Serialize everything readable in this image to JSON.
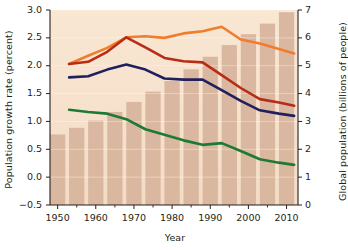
{
  "chart_data": {
    "type": "bar",
    "title": "",
    "subtitle": "",
    "xlabel": "Year",
    "ylabel": "Population growth rate (percent)",
    "ylabel_right": "Global population (billions of people)",
    "xlim": [
      1948,
      2013
    ],
    "ylim": [
      -0.5,
      3.0
    ],
    "ylim_right": [
      0,
      7
    ],
    "ytick_labels": [
      "3.0",
      "2.5",
      "2.0",
      "1.5",
      "1.0",
      "0.5",
      "0.0",
      "−0.5"
    ],
    "ytick_values": [
      3.0,
      2.5,
      2.0,
      1.5,
      1.0,
      0.5,
      0.0,
      -0.5
    ],
    "ytick_right_labels": [
      "7",
      "6",
      "5",
      "4",
      "3",
      "2",
      "1",
      "0"
    ],
    "ytick_right_values": [
      7,
      6,
      5,
      4,
      3,
      2,
      1,
      0
    ],
    "xtick_labels": [
      "1950",
      "1960",
      "1970",
      "1980",
      "1990",
      "2000",
      "2010"
    ],
    "xtick_values": [
      1950,
      1960,
      1970,
      1980,
      1990,
      2000,
      2010
    ],
    "xminor_values": [
      1955,
      1965,
      1975,
      1985,
      1995,
      2005
    ],
    "grid": "horizontal-light",
    "legend_position": "none",
    "plot_background": "#f7e3cf",
    "bars": {
      "name": "Global population",
      "axis": "right",
      "color": "#d8b49d",
      "categories": [
        1950,
        1955,
        1960,
        1965,
        1970,
        1975,
        1980,
        1985,
        1990,
        1995,
        2000,
        2005,
        2010
      ],
      "values": [
        2.53,
        2.77,
        3.03,
        3.34,
        3.7,
        4.07,
        4.45,
        4.87,
        5.32,
        5.74,
        6.13,
        6.51,
        6.92
      ]
    },
    "series": [
      {
        "name": "Less developed regions growth rate",
        "color": "#ef7d2c",
        "axis": "left",
        "x": [
          1953,
          1958,
          1963,
          1968,
          1973,
          1978,
          1983,
          1988,
          1993,
          1998,
          2003,
          2008,
          2012
        ],
        "values": [
          2.03,
          2.18,
          2.32,
          2.51,
          2.53,
          2.5,
          2.58,
          2.62,
          2.7,
          2.47,
          2.4,
          2.3,
          2.22
        ]
      },
      {
        "name": "World growth rate",
        "color": "#b82c17",
        "axis": "left",
        "x": [
          1953,
          1958,
          1963,
          1968,
          1973,
          1978,
          1983,
          1988,
          1993,
          1998,
          2003,
          2008,
          2012
        ],
        "values": [
          2.03,
          2.07,
          2.25,
          2.51,
          2.33,
          2.14,
          2.08,
          2.06,
          1.83,
          1.6,
          1.4,
          1.34,
          1.28
        ]
      },
      {
        "name": "Developing growth rate",
        "color": "#21205e",
        "axis": "left",
        "x": [
          1953,
          1958,
          1963,
          1968,
          1973,
          1978,
          1983,
          1988,
          1993,
          1998,
          2003,
          2008,
          2012
        ],
        "values": [
          1.79,
          1.81,
          1.93,
          2.02,
          1.93,
          1.77,
          1.75,
          1.75,
          1.56,
          1.37,
          1.2,
          1.14,
          1.1
        ]
      },
      {
        "name": "More developed regions growth rate",
        "color": "#1d7a33",
        "axis": "left",
        "x": [
          1953,
          1958,
          1963,
          1968,
          1973,
          1978,
          1983,
          1988,
          1993,
          1998,
          2003,
          2008,
          2012
        ],
        "values": [
          1.21,
          1.17,
          1.14,
          1.04,
          0.86,
          0.76,
          0.66,
          0.58,
          0.61,
          0.47,
          0.32,
          0.26,
          0.22
        ]
      }
    ]
  }
}
